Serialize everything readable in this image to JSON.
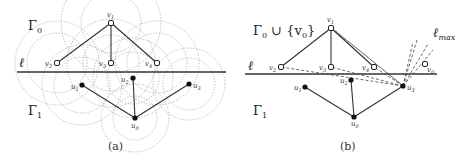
{
  "panels": [
    {
      "id": "a",
      "caption": "(a)",
      "upper_region_label": "Γ0",
      "lower_region_label": "Γ1",
      "line_label": "ℓ",
      "open_vertices": [
        {
          "name": "v1",
          "label": "v1"
        },
        {
          "name": "v2",
          "label": "v2"
        },
        {
          "name": "v3",
          "label": "v3"
        },
        {
          "name": "v4",
          "label": "v4"
        }
      ],
      "filled_vertices": [
        {
          "name": "u0",
          "label": "u0"
        },
        {
          "name": "u1",
          "label": "u1"
        },
        {
          "name": "u2",
          "label": "u2"
        },
        {
          "name": "u3",
          "label": "u3"
        }
      ],
      "edges": [
        [
          "v1",
          "v2"
        ],
        [
          "v1",
          "v3"
        ],
        [
          "v1",
          "v4"
        ],
        [
          "u0",
          "u1"
        ],
        [
          "u0",
          "u2"
        ],
        [
          "u0",
          "u3"
        ]
      ],
      "extras": "dotted circles around each vertex"
    },
    {
      "id": "b",
      "caption": "(b)",
      "upper_region_label": "Γ0 ∪ {v0}",
      "lower_region_label": "Γ1",
      "line_label": "ℓ",
      "max_line_label": "ℓmax",
      "open_vertices": [
        {
          "name": "v0",
          "label": "v0"
        },
        {
          "name": "v1",
          "label": "v1"
        },
        {
          "name": "v2",
          "label": "v2"
        },
        {
          "name": "v3",
          "label": "v3"
        },
        {
          "name": "v4",
          "label": "v4"
        }
      ],
      "filled_vertices": [
        {
          "name": "u0",
          "label": "u0"
        },
        {
          "name": "u1",
          "label": "u1"
        },
        {
          "name": "u2",
          "label": "u2"
        },
        {
          "name": "u3",
          "label": "u3"
        }
      ],
      "edges": [
        [
          "v1",
          "v2"
        ],
        [
          "v1",
          "v3"
        ],
        [
          "v1",
          "v4"
        ],
        [
          "u0",
          "u1"
        ],
        [
          "u0",
          "u2"
        ],
        [
          "u0",
          "u3"
        ]
      ],
      "extras": "dashed lines from u3 towards v1, v2, v3, v4 and upward rays labelled ℓmax"
    }
  ],
  "text": {
    "a_caption": "(a)",
    "b_caption": "(b)",
    "gamma0": "Γ",
    "gamma0_sub": "0",
    "gamma1": "Γ",
    "gamma1_sub": "1",
    "gamma0_union": " ∪ {v",
    "gamma0_union_sub": "0",
    "gamma0_union_close": "}",
    "ell": "ℓ",
    "ellmax": "ℓ",
    "ellmax_sub": "max",
    "v": "v",
    "u": "u",
    "s0": "0",
    "s1": "1",
    "s2": "2",
    "s3": "3",
    "s4": "4"
  }
}
